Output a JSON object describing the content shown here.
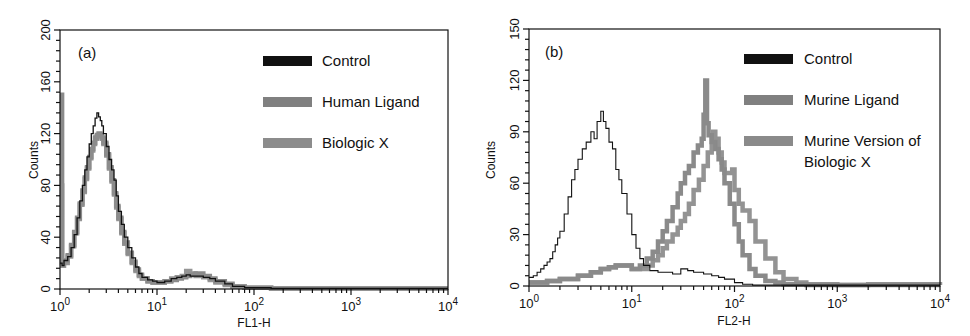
{
  "chart_data": [
    {
      "type": "line",
      "subtype": "flow-cytometry-histogram",
      "panel_label": "(a)",
      "xlabel": "FL1-H",
      "ylabel": "Counts",
      "xscale": "log",
      "xlim": [
        1,
        10000
      ],
      "ylim": [
        0,
        200
      ],
      "x_ticks": [
        {
          "value": 1,
          "base": "10",
          "exp": "0"
        },
        {
          "value": 10,
          "base": "10",
          "exp": "1"
        },
        {
          "value": 100,
          "base": "10",
          "exp": "2"
        },
        {
          "value": 1000,
          "base": "10",
          "exp": "3"
        },
        {
          "value": 10000,
          "base": "10",
          "exp": "4"
        }
      ],
      "y_ticks": [
        0,
        40,
        80,
        120,
        160,
        200
      ],
      "grid": false,
      "legend_position": "upper right",
      "series": [
        {
          "name": "Control",
          "color": "#111111",
          "width": 1.3,
          "x": [
            1.0,
            1.05,
            1.1,
            1.2,
            1.3,
            1.4,
            1.5,
            1.6,
            1.7,
            1.8,
            1.9,
            2.0,
            2.1,
            2.2,
            2.3,
            2.4,
            2.5,
            2.6,
            2.7,
            2.8,
            3.0,
            3.2,
            3.4,
            3.6,
            3.8,
            4.0,
            4.3,
            4.6,
            5.0,
            5.5,
            6.0,
            6.5,
            7.0,
            8.0,
            9.0,
            10,
            12,
            14,
            16,
            18,
            20,
            22,
            25,
            30,
            35,
            40,
            50,
            60,
            80,
            100,
            150,
            300,
            1000,
            3000,
            10000
          ],
          "y": [
            20,
            18,
            22,
            25,
            32,
            42,
            55,
            68,
            80,
            92,
            102,
            112,
            120,
            126,
            132,
            136,
            133,
            130,
            126,
            120,
            110,
            100,
            92,
            84,
            72,
            60,
            50,
            40,
            32,
            24,
            17,
            12,
            9,
            7,
            6,
            5,
            6,
            8,
            9,
            10,
            11,
            10,
            10,
            9,
            8,
            6,
            4,
            2,
            1,
            1,
            0.5,
            0.5,
            0.5,
            0.5,
            0.5
          ]
        },
        {
          "name": "Human Ligand",
          "color": "#808080",
          "width": 4.5,
          "x": [
            1.0,
            1.05,
            1.1,
            1.2,
            1.3,
            1.4,
            1.5,
            1.6,
            1.7,
            1.8,
            1.9,
            2.0,
            2.1,
            2.2,
            2.3,
            2.4,
            2.5,
            2.6,
            2.7,
            2.8,
            3.0,
            3.2,
            3.4,
            3.6,
            3.8,
            4.0,
            4.3,
            4.6,
            5.0,
            5.5,
            6.0,
            6.5,
            7.0,
            8.0,
            9.0,
            10,
            12,
            14,
            16,
            18,
            20,
            22,
            25,
            30,
            35,
            40,
            50,
            60,
            80,
            100,
            150,
            300,
            1000,
            3000,
            10000
          ],
          "y": [
            150,
            20,
            22,
            26,
            34,
            44,
            55,
            66,
            76,
            86,
            94,
            102,
            108,
            113,
            117,
            119,
            120,
            119,
            117,
            113,
            104,
            94,
            84,
            74,
            64,
            55,
            44,
            36,
            28,
            21,
            15,
            11,
            8,
            6,
            5,
            5,
            6,
            7,
            8,
            9,
            10,
            11,
            12,
            10,
            8,
            6,
            4,
            2,
            1,
            1,
            0.5,
            0.5,
            0.5,
            0.5,
            0.5
          ]
        },
        {
          "name": "Biologic X",
          "color": "#8c8c8c",
          "width": 4.5,
          "x": [
            1.0,
            1.05,
            1.1,
            1.2,
            1.3,
            1.4,
            1.5,
            1.6,
            1.7,
            1.8,
            1.9,
            2.0,
            2.1,
            2.2,
            2.3,
            2.4,
            2.5,
            2.6,
            2.7,
            2.8,
            3.0,
            3.2,
            3.4,
            3.6,
            3.8,
            4.0,
            4.3,
            4.6,
            5.0,
            5.5,
            6.0,
            6.5,
            7.0,
            8.0,
            9.0,
            10,
            12,
            14,
            16,
            18,
            20,
            22,
            25,
            30,
            35,
            40,
            50,
            60,
            80,
            100,
            150,
            300,
            1000,
            3000,
            10000
          ],
          "y": [
            80,
            18,
            20,
            25,
            33,
            43,
            54,
            65,
            75,
            85,
            93,
            101,
            107,
            112,
            116,
            118,
            119,
            118,
            116,
            112,
            103,
            93,
            83,
            73,
            63,
            54,
            43,
            35,
            27,
            20,
            14,
            10,
            8,
            6,
            5,
            5,
            6,
            8,
            9,
            10,
            14,
            12,
            10,
            9,
            7,
            5,
            3,
            2,
            1,
            1,
            0.5,
            0.5,
            0.5,
            0.5,
            0.5
          ]
        }
      ]
    },
    {
      "type": "line",
      "subtype": "flow-cytometry-histogram",
      "panel_label": "(b)",
      "xlabel": "FL2-H",
      "ylabel": "Counts",
      "xscale": "log",
      "xlim": [
        1,
        10000
      ],
      "ylim": [
        0,
        150
      ],
      "x_ticks": [
        {
          "value": 1,
          "base": "10",
          "exp": "0"
        },
        {
          "value": 10,
          "base": "10",
          "exp": "1"
        },
        {
          "value": 100,
          "base": "10",
          "exp": "2"
        },
        {
          "value": 1000,
          "base": "10",
          "exp": "3"
        },
        {
          "value": 10000,
          "base": "10",
          "exp": "4"
        }
      ],
      "y_ticks": [
        0,
        30,
        60,
        90,
        120,
        150
      ],
      "grid": false,
      "legend_position": "upper right",
      "series": [
        {
          "name": "Control",
          "color": "#111111",
          "width": 1.1,
          "x": [
            1.0,
            1.1,
            1.2,
            1.3,
            1.4,
            1.5,
            1.6,
            1.7,
            1.8,
            1.9,
            2.0,
            2.2,
            2.4,
            2.6,
            2.8,
            3.0,
            3.3,
            3.6,
            4.0,
            4.3,
            4.6,
            5.0,
            5.3,
            5.6,
            6.0,
            6.5,
            7.0,
            7.5,
            8.0,
            9.0,
            10,
            11,
            12,
            13,
            15,
            18,
            20,
            25,
            30,
            35,
            40,
            50,
            60,
            70,
            80,
            100,
            120,
            150,
            300,
            1000,
            10000
          ],
          "y": [
            5,
            6,
            8,
            10,
            12,
            14,
            16,
            20,
            24,
            28,
            32,
            42,
            52,
            62,
            68,
            74,
            80,
            84,
            90,
            86,
            96,
            102,
            96,
            92,
            84,
            80,
            68,
            62,
            54,
            42,
            30,
            22,
            16,
            12,
            9,
            8,
            8,
            7,
            10,
            9,
            8,
            7,
            6,
            5,
            4,
            2,
            1,
            0.5,
            0.5,
            0.5,
            0.5
          ]
        },
        {
          "name": "Murine Ligand",
          "color": "#808080",
          "width": 4.5,
          "x": [
            1.0,
            1.5,
            2.0,
            3.0,
            4.0,
            5.0,
            6.0,
            7.0,
            8.0,
            10,
            12,
            14,
            16,
            18,
            20,
            22,
            25,
            28,
            30,
            33,
            36,
            40,
            44,
            48,
            50,
            52,
            54,
            56,
            60,
            65,
            70,
            75,
            80,
            90,
            100,
            110,
            120,
            140,
            160,
            200,
            250,
            300,
            500,
            1000,
            2000,
            10000
          ],
          "y": [
            2,
            3,
            4,
            6,
            8,
            10,
            11,
            12,
            12,
            10,
            12,
            16,
            20,
            26,
            32,
            38,
            46,
            54,
            60,
            66,
            70,
            78,
            82,
            86,
            100,
            120,
            95,
            88,
            84,
            80,
            74,
            68,
            60,
            48,
            36,
            26,
            18,
            10,
            6,
            3,
            2,
            1,
            0.5,
            0.5,
            0.5,
            0.5
          ]
        },
        {
          "name": "Murine Version of Biologic X",
          "color": "#8a8a8a",
          "width": 4.5,
          "x": [
            1.0,
            1.5,
            2.0,
            3.0,
            4.0,
            5.0,
            6.0,
            7.0,
            8.0,
            10,
            12,
            14,
            16,
            18,
            20,
            22,
            25,
            28,
            30,
            33,
            36,
            40,
            45,
            50,
            55,
            60,
            62,
            65,
            70,
            75,
            80,
            90,
            95,
            100,
            110,
            120,
            140,
            160,
            200,
            250,
            300,
            400,
            500,
            1000,
            2000,
            10000
          ],
          "y": [
            2,
            3,
            4,
            6,
            8,
            10,
            11,
            12,
            12,
            10,
            10,
            12,
            15,
            18,
            22,
            26,
            30,
            34,
            38,
            42,
            48,
            56,
            62,
            70,
            78,
            86,
            90,
            86,
            78,
            72,
            66,
            66,
            68,
            56,
            48,
            44,
            38,
            26,
            16,
            8,
            4,
            2,
            1,
            0.5,
            1,
            0.5
          ]
        }
      ]
    }
  ],
  "panels": [
    {
      "label": "(a)",
      "ylabel": "Counts",
      "xlabel": "FL1-H",
      "y_tick_labels": [
        "0",
        "40",
        "80",
        "120",
        "160",
        "200"
      ],
      "legend": [
        {
          "label": "Control",
          "color": "#111111"
        },
        {
          "label": "Human Ligand",
          "color": "#808080"
        },
        {
          "label": "Biologic X",
          "color": "#8c8c8c"
        }
      ]
    },
    {
      "label": "(b)",
      "ylabel": "Counts",
      "xlabel": "FL2-H",
      "y_tick_labels": [
        "0",
        "30",
        "60",
        "90",
        "120",
        "150"
      ],
      "legend": [
        {
          "label": "Control",
          "color": "#111111"
        },
        {
          "label": "Murine Ligand",
          "color": "#808080"
        },
        {
          "label_line1": "Murine Version of",
          "label_line2": "Biologic X",
          "color": "#8a8a8a"
        }
      ]
    }
  ]
}
